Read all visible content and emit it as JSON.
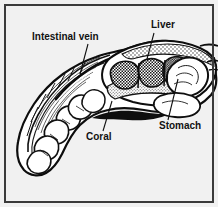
{
  "figure": {
    "type": "line-drawing",
    "background_color": "#f1f1f1",
    "ink_color": "#101010",
    "frame_color": "#3b3b3b"
  },
  "labels": [
    {
      "id": "intestinal-vein",
      "text": "Intestinal vein",
      "x": 32,
      "y": 32,
      "leader_from": [
        88,
        44
      ],
      "leader_to": [
        80,
        74
      ]
    },
    {
      "id": "liver",
      "text": "Liver",
      "x": 151,
      "y": 20,
      "leader_from": [
        152,
        33
      ],
      "leader_to": [
        146,
        59
      ]
    },
    {
      "id": "coral",
      "text": "Coral",
      "x": 86,
      "y": 132,
      "leader_from": [
        103,
        131
      ],
      "leader_to": [
        112,
        101
      ]
    },
    {
      "id": "stomach",
      "text": "Stomach",
      "x": 159,
      "y": 121,
      "leader_from": [
        168,
        120
      ],
      "leader_to": [
        178,
        78
      ]
    }
  ],
  "frame": {
    "inset": 5,
    "stroke_width": 2,
    "color": "#3b3b3b"
  },
  "shading": {
    "liver_fill": "checker",
    "coral_fill": "stipple",
    "body_fill": "#ffffff",
    "outline_fill": "#111111"
  }
}
